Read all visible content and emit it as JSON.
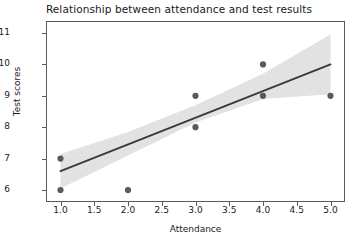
{
  "chart_data": {
    "type": "scatter",
    "title": "Relationship between attendance and test results",
    "xlabel": "Attendance",
    "ylabel": "Test scores",
    "xlim": [
      0.8,
      5.2
    ],
    "ylim": [
      5.65,
      11.35
    ],
    "grid": false,
    "legend": null,
    "xticks": [
      "1.0",
      "1.5",
      "2.0",
      "2.5",
      "3.0",
      "3.5",
      "4.0",
      "4.5",
      "5.0"
    ],
    "xtick_values": [
      1.0,
      1.5,
      2.0,
      2.5,
      3.0,
      3.5,
      4.0,
      4.5,
      5.0
    ],
    "yticks": [
      "6",
      "7",
      "8",
      "9",
      "10",
      "11"
    ],
    "ytick_values": [
      6,
      7,
      8,
      9,
      10,
      11
    ],
    "points": [
      {
        "x": 1.0,
        "y": 7
      },
      {
        "x": 1.0,
        "y": 6
      },
      {
        "x": 2.0,
        "y": 6
      },
      {
        "x": 3.0,
        "y": 9
      },
      {
        "x": 3.0,
        "y": 8
      },
      {
        "x": 4.0,
        "y": 10
      },
      {
        "x": 4.0,
        "y": 9
      },
      {
        "x": 5.0,
        "y": 9
      }
    ],
    "regression_line": {
      "name": "fit",
      "x": [
        1.0,
        5.0
      ],
      "y": [
        6.6,
        10.0
      ],
      "slope": 0.85,
      "intercept": 5.75
    },
    "confidence_band": {
      "name": "95% confidence interval",
      "x": [
        1.0,
        2.0,
        3.0,
        4.0,
        5.0
      ],
      "upper": [
        7.15,
        7.85,
        8.7,
        9.7,
        10.95
      ],
      "lower": [
        6.05,
        7.1,
        8.15,
        8.9,
        9.05
      ]
    },
    "colors": {
      "line": "#3a3a3a",
      "marker": "#555b5e",
      "band": "#e2e2e2",
      "axis": "#555b5e",
      "text": "#1a1a1a",
      "background": "#ffffff"
    }
  }
}
